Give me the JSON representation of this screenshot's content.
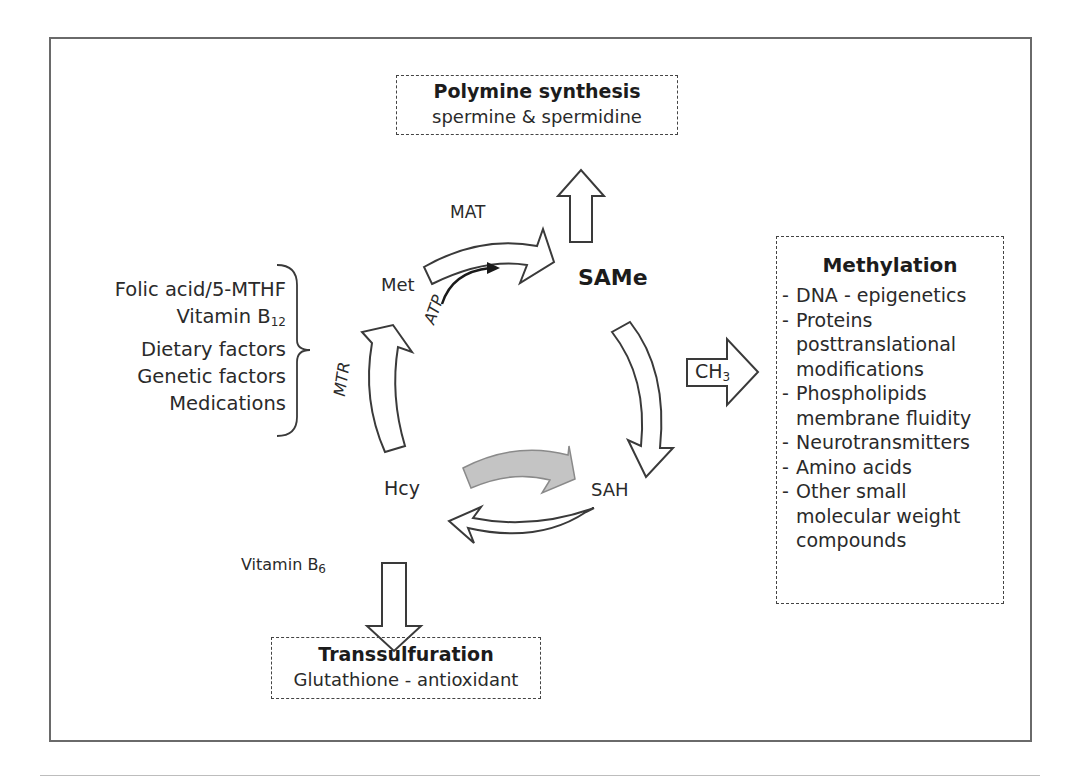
{
  "polyamine": {
    "title": "Polymine synthesis",
    "subtitle": "spermine & spermidine"
  },
  "methylation": {
    "title": "Methylation",
    "items": [
      {
        "dash": "-",
        "lines": [
          "DNA - epigenetics"
        ]
      },
      {
        "dash": "-",
        "lines": [
          "Proteins",
          "posttranslational",
          "modifications"
        ]
      },
      {
        "dash": "-",
        "lines": [
          "Phospholipids",
          "membrane fluidity"
        ]
      },
      {
        "dash": "-",
        "lines": [
          "Neurotransmitters"
        ]
      },
      {
        "dash": "-",
        "lines": [
          "Amino acids"
        ]
      },
      {
        "dash": "-",
        "lines": [
          "Other small",
          "molecular weight",
          "compounds"
        ]
      }
    ]
  },
  "transsulfuration": {
    "title": "Transsulfuration",
    "subtitle": "Glutathione - antioxidant"
  },
  "factors": {
    "items": [
      {
        "text": "Folic acid/5-MTHF",
        "sub": ""
      },
      {
        "text": "Vitamin B",
        "sub": "12"
      },
      {
        "text": "Dietary factors",
        "sub": ""
      },
      {
        "text": "Genetic factors",
        "sub": ""
      },
      {
        "text": "Medications",
        "sub": ""
      }
    ]
  },
  "cycle": {
    "met": "Met",
    "mat": "MAT",
    "atp": "ATP",
    "same": "SAMe",
    "sah": "SAH",
    "hcy": "Hcy",
    "mtr": "MTR",
    "ch3": {
      "text": "CH",
      "sub": "3"
    },
    "vitamin_b6": {
      "text": "Vitamin B",
      "sub": "6"
    }
  },
  "colors": {
    "line": "#3a3a3a",
    "gray_arrow_fill": "#c4c4c4",
    "gray_arrow_stroke": "#8a8a8a",
    "frame": "#6a6a6a"
  }
}
